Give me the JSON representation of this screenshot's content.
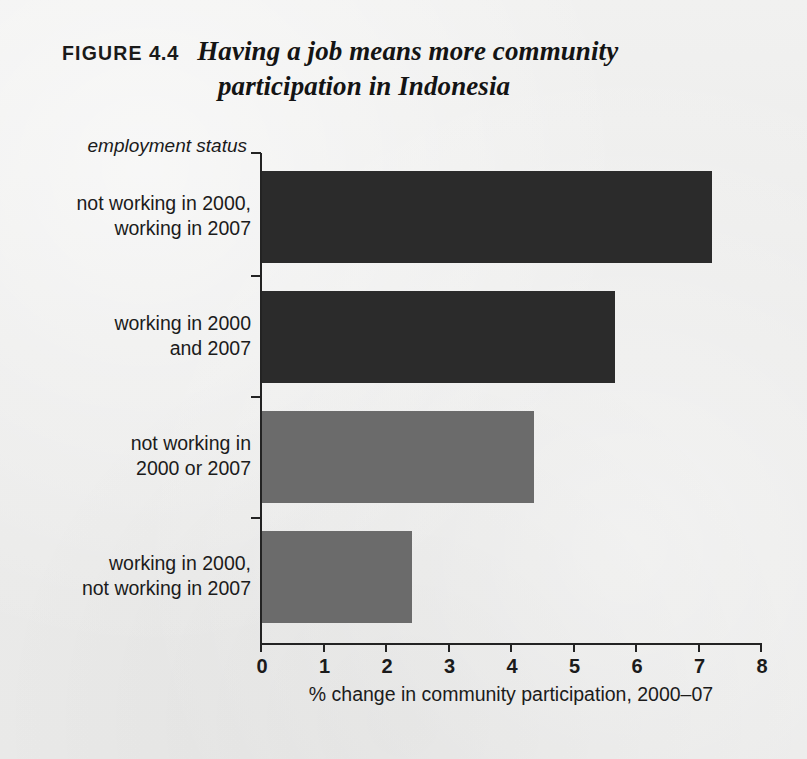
{
  "figure": {
    "label": "FIGURE",
    "number": "4.4",
    "title_line1": "Having a job means more community",
    "title_line2": "participation in Indonesia"
  },
  "colors": {
    "background": "#ececeb",
    "dark_bar": "#2b2b2b",
    "gray_bar": "#6b6b6b",
    "axis": "#232323",
    "text": "#1b1b1b"
  },
  "chart_data": {
    "type": "bar",
    "orientation": "horizontal",
    "title": "Having a job means more community participation in Indonesia",
    "xlabel": "% change in community participation, 2000–07",
    "ylabel": "employment status",
    "xlim": [
      0,
      8
    ],
    "xticks": [
      "0",
      "1",
      "2",
      "3",
      "4",
      "5",
      "6",
      "7",
      "8"
    ],
    "grid": false,
    "legend": "none",
    "categories": [
      "not working in 2000, working in 2007",
      "working in 2000 and 2007",
      "not working in 2000 or 2007",
      "working in 2000, not working in 2007"
    ],
    "values": [
      7.2,
      5.65,
      4.35,
      2.4
    ],
    "bar_colors": [
      "#2b2b2b",
      "#2b2b2b",
      "#6b6b6b",
      "#6b6b6b"
    ],
    "bars": [
      {
        "label_line1": "not working in 2000,",
        "label_line2": "working in 2007",
        "value": 7.2,
        "color": "#2b2b2b"
      },
      {
        "label_line1": "working in 2000",
        "label_line2": "and 2007",
        "value": 5.65,
        "color": "#2b2b2b"
      },
      {
        "label_line1": "not working in",
        "label_line2": "2000 or 2007",
        "value": 4.35,
        "color": "#6b6b6b"
      },
      {
        "label_line1": "working in 2000,",
        "label_line2": "not working in 2007",
        "value": 2.4,
        "color": "#6b6b6b"
      }
    ]
  }
}
